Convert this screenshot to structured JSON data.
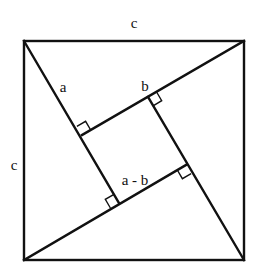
{
  "diagram": {
    "type": "geometry",
    "labels": {
      "top_side": "c",
      "left_side": "c",
      "leg_a": "a",
      "leg_b": "b",
      "inner_side": "a - b"
    },
    "outer_square": {
      "tl": [
        24,
        41
      ],
      "tr": [
        244,
        41
      ],
      "br": [
        244,
        260
      ],
      "bl": [
        24,
        260
      ]
    },
    "inner_square": {
      "left": [
        82,
        135
      ],
      "top": [
        148,
        97
      ],
      "right": [
        186,
        165
      ],
      "bottom": [
        119,
        203
      ]
    },
    "stroke_color": "#111111",
    "background": "#ffffff"
  }
}
